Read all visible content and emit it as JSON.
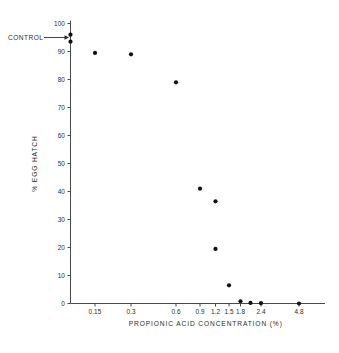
{
  "chart_data": {
    "type": "scatter",
    "title": "",
    "xlabel": "PROPIONIC  ACID  CONCENTRATION (%)",
    "ylabel": "% EGG  HATCH",
    "ylim": [
      0,
      100
    ],
    "yticks": [
      0,
      10,
      20,
      30,
      40,
      50,
      60,
      70,
      80,
      90,
      100
    ],
    "ytick_labels": [
      "0",
      "10",
      "20",
      "30",
      "40",
      "50",
      "60",
      "70",
      "80",
      "90",
      "100"
    ],
    "xtick_labels": [
      "0.15",
      "0.3",
      "0.6",
      "0.9",
      "1.2",
      "1.5",
      "1.8",
      "2.4",
      "4.8"
    ],
    "xtick_values": [
      0.15,
      0.3,
      0.6,
      0.9,
      1.2,
      1.5,
      1.8,
      2.4,
      4.8
    ],
    "x_scale": "non-linear category spacing",
    "grid": false,
    "legend": null,
    "annotations": [
      {
        "text": "CONTROL",
        "points_to_x": 0.0,
        "points_to_y": 95.0,
        "arrow": "right"
      }
    ],
    "points": [
      {
        "x": 0.0,
        "y": 96.0,
        "label": "control-1"
      },
      {
        "x": 0.0,
        "y": 93.5,
        "label": "control-2"
      },
      {
        "x": 0.15,
        "y": 89.5,
        "label": "p-0.15"
      },
      {
        "x": 0.3,
        "y": 89.0,
        "label": "p-0.3"
      },
      {
        "x": 0.6,
        "y": 79.0,
        "label": "p-0.6"
      },
      {
        "x": 0.9,
        "y": 41.0,
        "label": "p-0.9"
      },
      {
        "x": 1.2,
        "y": 36.5,
        "label": "p-1.2a"
      },
      {
        "x": 1.2,
        "y": 19.5,
        "label": "p-1.2b"
      },
      {
        "x": 1.5,
        "y": 6.5,
        "label": "p-1.5"
      },
      {
        "x": 1.8,
        "y": 0.8,
        "label": "p-1.8"
      },
      {
        "x": 2.1,
        "y": 0.2,
        "label": "p-2.1"
      },
      {
        "x": 2.4,
        "y": 0.1,
        "label": "p-2.4"
      },
      {
        "x": 4.8,
        "y": 0.0,
        "label": "p-4.8"
      }
    ],
    "point_color": "#111111",
    "axis_color": "#4a4a4a"
  }
}
